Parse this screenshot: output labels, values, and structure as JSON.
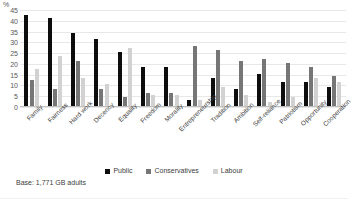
{
  "axis": {
    "unit_label": "%",
    "ticks": [
      "45",
      "40",
      "35",
      "30",
      "25",
      "20",
      "15",
      "10",
      "5",
      "0"
    ]
  },
  "legend": {
    "items": [
      {
        "label": "Public",
        "color": "#0d0d0d"
      },
      {
        "label": "Conservatives",
        "color": "#767676"
      },
      {
        "label": "Labour",
        "color": "#d2d2d2"
      }
    ]
  },
  "footnote": "Base: 1,771 GB adults",
  "chart_data": {
    "type": "bar",
    "title": "",
    "xlabel": "",
    "ylabel": "%",
    "ylim": [
      0,
      45
    ],
    "ytick_step": 5,
    "grid": true,
    "legend_position": "bottom",
    "categories": [
      "Family",
      "Fairness",
      "Hard work",
      "Decency",
      "Equality",
      "Freedom",
      "Morality",
      "Entrepreneurship",
      "Tradition",
      "Ambition",
      "Self-reliance",
      "Patriotism",
      "Opportunity",
      "Cooperation"
    ],
    "series": [
      {
        "name": "Public",
        "color": "#0d0d0d",
        "values": [
          42,
          41,
          34,
          31,
          25,
          18,
          18,
          3,
          13,
          8,
          15,
          11,
          11,
          9
        ]
      },
      {
        "name": "Conservatives",
        "color": "#767676",
        "values": [
          12,
          8,
          21,
          8,
          4,
          6,
          6,
          28,
          26,
          21,
          22,
          20,
          18,
          14
        ]
      },
      {
        "name": "Labour",
        "color": "#d2d2d2",
        "values": [
          17,
          23,
          13,
          10,
          27,
          5,
          5,
          3,
          9,
          5,
          2,
          4,
          13,
          11
        ]
      }
    ]
  }
}
